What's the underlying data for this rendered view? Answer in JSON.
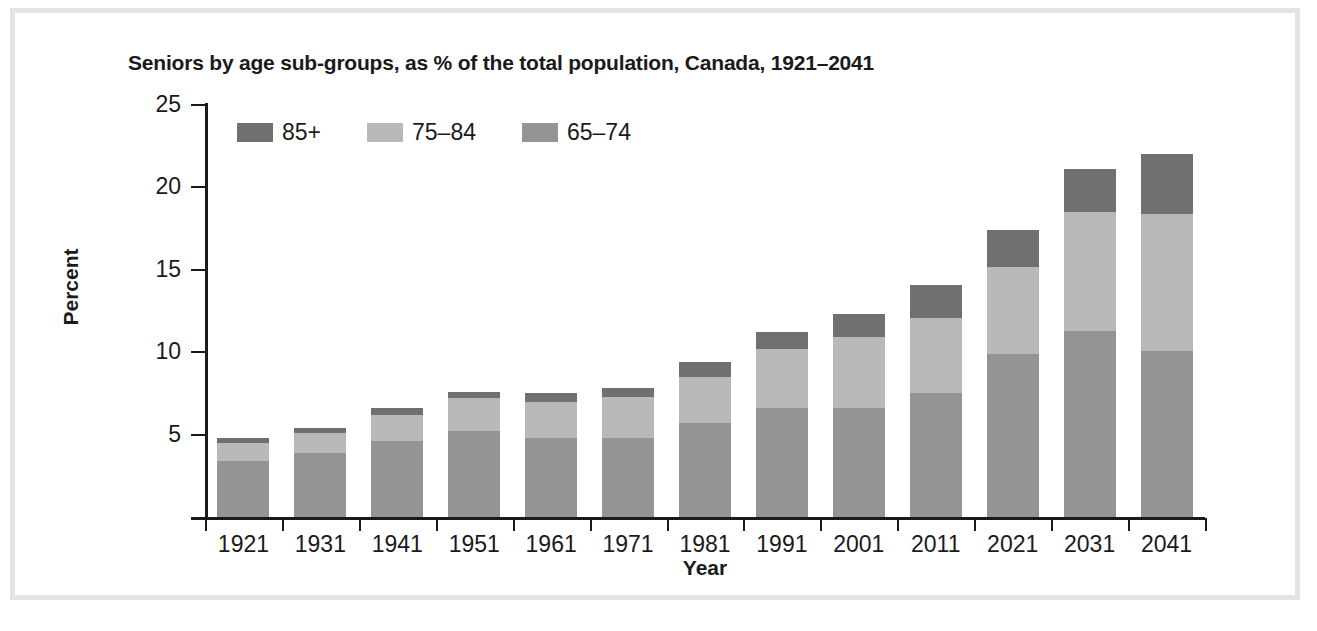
{
  "chart_data": {
    "type": "bar",
    "title": "Seniors by age sub-groups, as % of the total population, Canada, 1921–2041",
    "xlabel": "Year",
    "ylabel": "Percent",
    "ylim": [
      0,
      25
    ],
    "yticks": [
      5,
      10,
      15,
      20,
      25
    ],
    "grid": false,
    "legend_position": "top-left",
    "stacked": true,
    "categories": [
      "1921",
      "1931",
      "1941",
      "1951",
      "1961",
      "1971",
      "1981",
      "1991",
      "2001",
      "2011",
      "2021",
      "2031",
      "2041"
    ],
    "series": [
      {
        "name": "65–74",
        "color": "#949494",
        "values": [
          3.4,
          3.9,
          4.6,
          5.2,
          4.8,
          4.8,
          5.7,
          6.6,
          6.6,
          7.5,
          9.9,
          11.3,
          10.1
        ]
      },
      {
        "name": "75–84",
        "color": "#b9b9b9",
        "values": [
          1.1,
          1.2,
          1.6,
          2.0,
          2.2,
          2.5,
          2.8,
          3.6,
          4.3,
          4.6,
          5.3,
          7.2,
          8.3
        ]
      },
      {
        "name": "85+",
        "color": "#707070",
        "values": [
          0.3,
          0.3,
          0.4,
          0.4,
          0.5,
          0.5,
          0.9,
          1.0,
          1.4,
          2.0,
          2.2,
          2.6,
          3.6
        ]
      }
    ],
    "totals": [
      4.8,
      5.4,
      6.6,
      7.6,
      7.5,
      7.8,
      9.4,
      11.2,
      12.3,
      14.1,
      17.4,
      21.1,
      22.0
    ]
  },
  "legend": {
    "items": [
      {
        "label": "85+",
        "color": "#707070"
      },
      {
        "label": "75–84",
        "color": "#b9b9b9"
      },
      {
        "label": "65–74",
        "color": "#949494"
      }
    ]
  }
}
